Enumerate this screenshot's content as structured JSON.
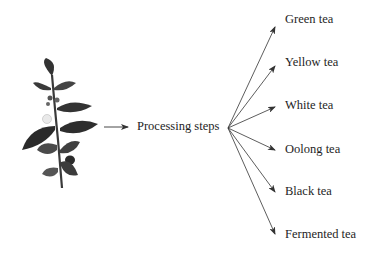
{
  "diagram": {
    "source": {
      "name": "tea-plant",
      "icon": "tea-plant-illustration"
    },
    "process_label": "Processing steps",
    "outputs": [
      {
        "label": "Green tea"
      },
      {
        "label": "Yellow tea"
      },
      {
        "label": "White tea"
      },
      {
        "label": "Oolong tea"
      },
      {
        "label": "Black tea"
      },
      {
        "label": "Fermented tea"
      }
    ],
    "colors": {
      "arrow": "#333333",
      "text": "#1e1e1e",
      "leaf_dark": "#2a2a2a",
      "leaf_mid": "#5a5a5a",
      "background": "#ffffff"
    }
  }
}
